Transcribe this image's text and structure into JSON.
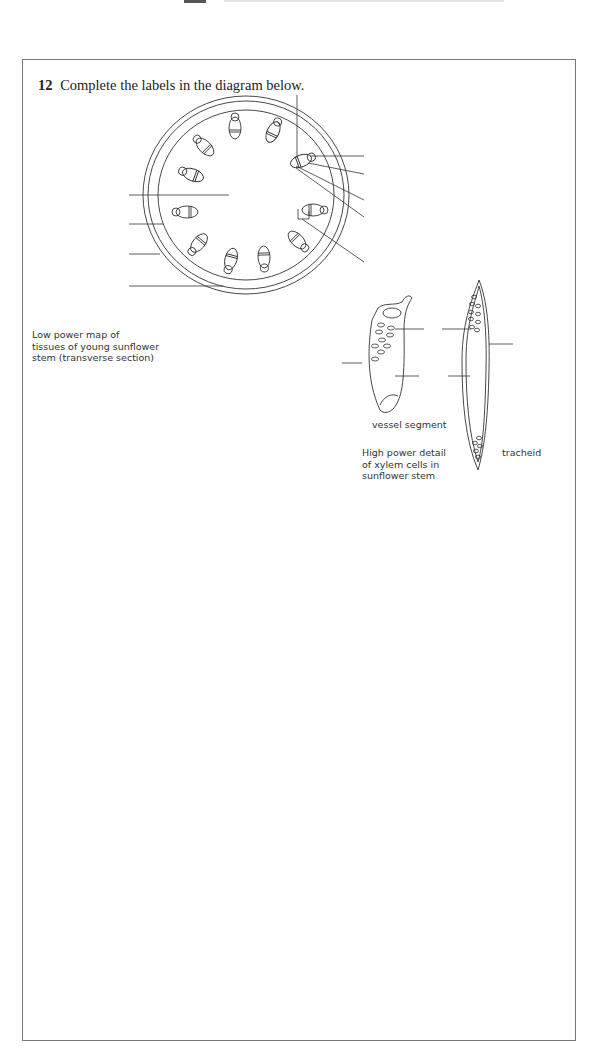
{
  "question": {
    "number": "12",
    "text": "Complete the labels in the diagram below."
  },
  "low_power": {
    "caption_lines": [
      "Low power map of",
      "tissues of young sunflower",
      "stem (transverse section)"
    ],
    "vascular_bundle_count": 11,
    "label_lines_left": 4,
    "label_lines_right": 5,
    "label_line_top": 1
  },
  "high_power": {
    "caption_lines": [
      "High power detail",
      "of xylem cells in",
      "sunflower stem"
    ],
    "vessel_label": "vessel segment",
    "tracheid_label": "tracheid"
  }
}
